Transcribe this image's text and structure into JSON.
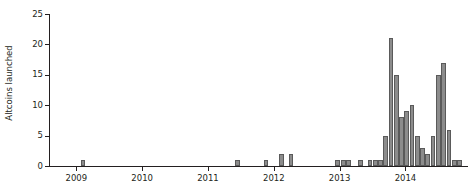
{
  "chart_data": {
    "type": "bar",
    "title": "",
    "xlabel": "",
    "ylabel": "Altcoins launched",
    "ylim": [
      0,
      25
    ],
    "yticks": [
      0,
      5,
      10,
      15,
      20,
      25
    ],
    "ytick_labels": [
      "0",
      "5",
      "10",
      "15",
      "20",
      "25"
    ],
    "grid": false,
    "legend": null,
    "xtick_labels": [
      "2009",
      "2010",
      "2011",
      "2012",
      "2013",
      "2014"
    ],
    "xtick_positions": [
      2009,
      2010,
      2011,
      2012,
      2013,
      2014
    ],
    "xlim": [
      2008.6,
      2014.95
    ],
    "bar_width_years": 0.072,
    "categories": [
      "2009.10",
      "2011.45",
      "2011.88",
      "2012.12",
      "2012.26",
      "2012.97",
      "2013.06",
      "2013.14",
      "2013.32",
      "2013.46",
      "2013.54",
      "2013.62",
      "2013.70",
      "2013.78",
      "2013.86",
      "2013.94",
      "2014.02",
      "2014.10",
      "2014.18",
      "2014.26",
      "2014.34",
      "2014.42",
      "2014.50",
      "2014.58",
      "2014.66",
      "2014.74",
      "2014.82"
    ],
    "values": [
      1,
      1,
      1,
      2,
      2,
      1,
      1,
      1,
      1,
      1,
      1,
      1,
      5,
      21,
      15,
      8,
      9,
      10,
      5,
      3,
      2,
      5,
      15,
      17,
      6,
      1,
      1
    ]
  }
}
